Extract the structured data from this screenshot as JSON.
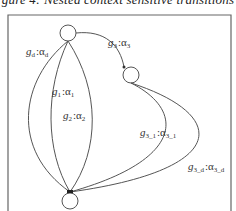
{
  "caption": "gure 4: Nested context sensitive transitions",
  "colors": {
    "stroke": "#555555",
    "frame": "#666666",
    "text": "#333333"
  },
  "nodes": [
    {
      "id": "top",
      "cx": 68,
      "cy": 33,
      "r": 8
    },
    {
      "id": "mid",
      "cx": 131,
      "cy": 75,
      "r": 8
    },
    {
      "id": "bottom",
      "cx": 70,
      "cy": 201,
      "r": 8
    }
  ],
  "edges": [
    {
      "id": "g4",
      "label": {
        "g": "g",
        "gsub": "d",
        "a": "α",
        "asub": "d"
      }
    },
    {
      "id": "g1",
      "label": {
        "g": "g",
        "gsub": "1",
        "a": "α",
        "asub": "1"
      }
    },
    {
      "id": "g2",
      "label": {
        "g": "g",
        "gsub": "2",
        "a": "α",
        "asub": "2"
      }
    },
    {
      "id": "g3",
      "label": {
        "g": "g",
        "gsub": "3",
        "a": "α",
        "asub": "3"
      }
    },
    {
      "id": "g31",
      "label": {
        "g": "g",
        "gsub": "3_1",
        "a": "α",
        "asub": "3_1"
      }
    },
    {
      "id": "g3d",
      "label": {
        "g": "g",
        "gsub": "3_d",
        "a": "α",
        "asub": "3_d"
      }
    }
  ],
  "separator": ":"
}
